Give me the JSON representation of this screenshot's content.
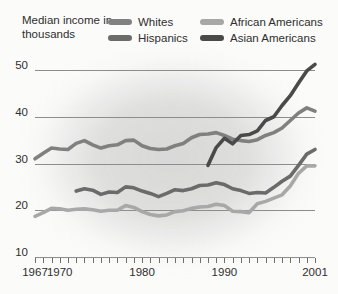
{
  "axis_title": "Median income\nin thousands",
  "legend": {
    "rows": [
      [
        {
          "label": "Whites",
          "color": "#808080",
          "icon": "legend-swatch"
        },
        {
          "label": "African Americans",
          "color": "#a8a8a8",
          "icon": "legend-swatch"
        }
      ],
      [
        {
          "label": "Hispanics",
          "color": "#6b6b6b",
          "icon": "legend-swatch"
        },
        {
          "label": "Asian Americans",
          "color": "#4a4a4a",
          "icon": "legend-swatch"
        }
      ]
    ]
  },
  "chart_data": {
    "type": "line",
    "title": "Median income in thousands",
    "xlabel": "",
    "ylabel": "Median income in thousands",
    "xlim": [
      1967,
      2001
    ],
    "ylim": [
      10,
      50
    ],
    "yticks": [
      50,
      40,
      30,
      20,
      10
    ],
    "xticks_labeled": [
      1967,
      1970,
      1980,
      1990,
      2001
    ],
    "xticks_all_years": true,
    "grid": "horizontal",
    "legend_position": "top",
    "series": [
      {
        "name": "Whites",
        "color": "#808080",
        "x": [
          1967,
          1968,
          1969,
          1970,
          1971,
          1972,
          1973,
          1974,
          1975,
          1976,
          1977,
          1978,
          1979,
          1980,
          1981,
          1982,
          1983,
          1984,
          1985,
          1986,
          1987,
          1988,
          1989,
          1990,
          1991,
          1992,
          1993,
          1994,
          1995,
          1996,
          1997,
          1998,
          1999,
          2000,
          2001
        ],
        "values": [
          31.0,
          32.2,
          33.3,
          33.1,
          33.0,
          34.3,
          34.9,
          34.0,
          33.3,
          33.8,
          34.0,
          34.9,
          35.0,
          33.8,
          33.2,
          33.0,
          33.1,
          33.8,
          34.3,
          35.5,
          36.2,
          36.3,
          36.6,
          36.0,
          35.2,
          34.9,
          34.7,
          35.1,
          36.0,
          36.6,
          37.6,
          39.2,
          40.8,
          41.9,
          41.2
        ]
      },
      {
        "name": "African Americans",
        "color": "#a8a8a8",
        "x": [
          1967,
          1968,
          1969,
          1970,
          1971,
          1972,
          1973,
          1974,
          1975,
          1976,
          1977,
          1978,
          1979,
          1980,
          1981,
          1982,
          1983,
          1984,
          1985,
          1986,
          1987,
          1988,
          1989,
          1990,
          1991,
          1992,
          1993,
          1994,
          1995,
          1996,
          1997,
          1998,
          1999,
          2000,
          2001
        ],
        "values": [
          18.7,
          19.5,
          20.4,
          20.3,
          20.0,
          20.2,
          20.3,
          20.1,
          19.8,
          20.0,
          20.0,
          21.0,
          20.6,
          19.7,
          19.1,
          18.8,
          19.0,
          19.7,
          19.9,
          20.4,
          20.7,
          20.8,
          21.3,
          21.0,
          19.8,
          19.7,
          19.5,
          21.4,
          21.9,
          22.6,
          23.3,
          25.2,
          27.9,
          29.5,
          29.5
        ]
      },
      {
        "name": "Hispanics",
        "color": "#6b6b6b",
        "x": [
          1972,
          1973,
          1974,
          1975,
          1976,
          1977,
          1978,
          1979,
          1980,
          1981,
          1982,
          1983,
          1984,
          1985,
          1986,
          1987,
          1988,
          1989,
          1990,
          1991,
          1992,
          1993,
          1994,
          1995,
          1996,
          1997,
          1998,
          1999,
          2000,
          2001
        ],
        "values": [
          24.1,
          24.6,
          24.3,
          23.4,
          23.9,
          23.8,
          25.0,
          24.8,
          24.1,
          23.6,
          22.9,
          23.6,
          24.4,
          24.2,
          24.6,
          25.3,
          25.4,
          25.9,
          25.5,
          24.6,
          24.2,
          23.6,
          23.8,
          23.7,
          24.9,
          26.2,
          27.3,
          29.6,
          32.0,
          33.0
        ]
      },
      {
        "name": "Asian Americans",
        "color": "#4a4a4a",
        "x": [
          1988,
          1989,
          1990,
          1991,
          1992,
          1993,
          1994,
          1995,
          1996,
          1997,
          1998,
          1999,
          2000,
          2001
        ],
        "values": [
          29.6,
          33.4,
          35.4,
          34.2,
          36.0,
          36.2,
          37.0,
          39.2,
          40.0,
          42.4,
          44.5,
          47.2,
          49.8,
          51.2
        ]
      }
    ]
  },
  "x_axis_labels": [
    {
      "year": 1967,
      "text": "1967"
    },
    {
      "year": 1970,
      "text": "1970"
    },
    {
      "year": 1980,
      "text": "1980"
    },
    {
      "year": 1990,
      "text": "1990"
    },
    {
      "year": 2001,
      "text": "2001"
    }
  ]
}
